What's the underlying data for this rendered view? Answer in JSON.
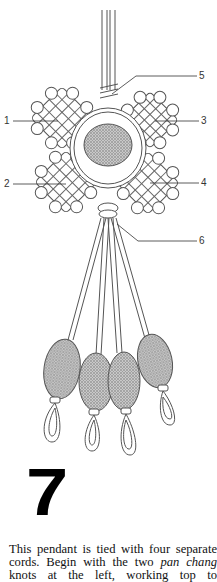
{
  "figure": {
    "callouts": [
      {
        "id": "1",
        "label": "1"
      },
      {
        "id": "2",
        "label": "2"
      },
      {
        "id": "3",
        "label": "3"
      },
      {
        "id": "4",
        "label": "4"
      },
      {
        "id": "5",
        "label": "5"
      },
      {
        "id": "6",
        "label": "6"
      }
    ]
  },
  "step_number": "7",
  "caption": {
    "line1_pre": "This pendant is tied with four separate cords. Begin with the two ",
    "emphasis": "pan chang",
    "line_post": " knots at the left, working top to"
  }
}
